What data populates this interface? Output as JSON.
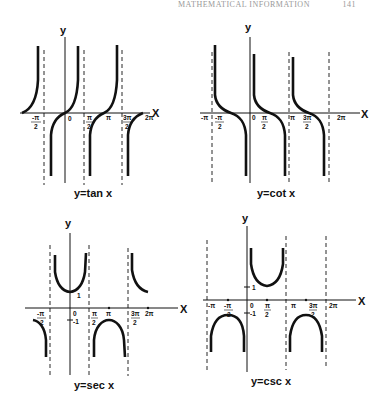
{
  "header": {
    "running_title": "MATHEMATICAL INFORMATION",
    "page_number": "141"
  },
  "graphs": [
    {
      "id": "tan",
      "title": "y = tan x",
      "x_axis_label": "X",
      "y_axis_label": "y",
      "tick_labels": [
        "-π/2",
        "0",
        "π/2",
        "π",
        "3π/2",
        "2π"
      ],
      "asymptotes": [
        "-π/2",
        "π/2",
        "3π/2"
      ]
    },
    {
      "id": "cot",
      "title": "y = cot x",
      "x_axis_label": "X",
      "y_axis_label": "y",
      "tick_labels": [
        "-π",
        "-π/2",
        "0",
        "π/2",
        "π",
        "3π/2",
        "2π"
      ],
      "asymptotes": [
        "-π",
        "π",
        "2π"
      ]
    },
    {
      "id": "sec",
      "title": "y = sec x",
      "x_axis_label": "X",
      "y_axis_label": "y",
      "tick_labels": [
        "-π/2",
        "0",
        "1",
        "-1",
        "π/2",
        "π",
        "3π/2",
        "2π"
      ],
      "asymptotes": [
        "-π/2",
        "π/2",
        "3π/2"
      ]
    },
    {
      "id": "csc",
      "title": "y = csc x",
      "x_axis_label": "X",
      "y_axis_label": "y",
      "tick_labels": [
        "-π",
        "-π/2",
        "0",
        "1",
        "-1",
        "π/2",
        "π",
        "3π/2",
        "2π"
      ],
      "asymptotes": [
        "-π",
        "π",
        "2π"
      ]
    }
  ],
  "labels": {
    "tan_title": "y=tan x",
    "cot_title": "y=cot x",
    "sec_title": "y=sec x",
    "csc_title": "y=csc x",
    "x": "X",
    "y": "y",
    "zero": "0",
    "one": "1",
    "neg_one": "-1",
    "pi": "π",
    "two_pi": "2π",
    "neg_pi": "-π",
    "pi_num": "π",
    "neg_pi_num": "-π",
    "three_pi_num": "3π",
    "denom_2": "2"
  }
}
